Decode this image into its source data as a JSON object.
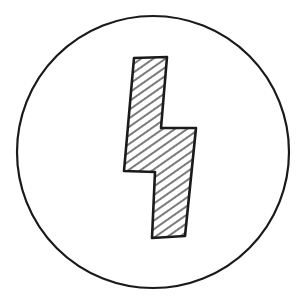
{
  "image": {
    "description": "Hand-drawn lightning bolt symbol inside a circle",
    "icon": "lightning-bolt-icon",
    "stroke_color": "#1a1a1a",
    "background_color": "#ffffff",
    "fill_pattern": "diagonal-hatching"
  }
}
